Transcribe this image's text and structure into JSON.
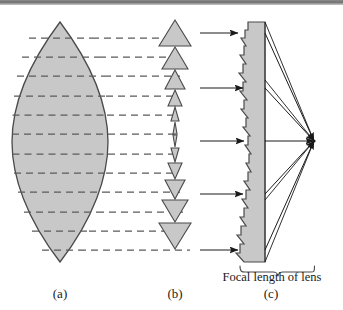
{
  "figure": {
    "background_color": "#ffffff",
    "glass_fill_color": "#c8c8c8",
    "outline_color": "#4a4a4a",
    "ray_color": "#1a1a1a",
    "dash_color": "#5a5a5a",
    "top_band_color": "#6f6f6f"
  },
  "labels": {
    "panel_a": "(a)",
    "panel_b": "(b)",
    "panel_c": "(c)",
    "focal_length_caption": "Focal length of lens"
  },
  "panels": {
    "a": {
      "name": "biconvex-lens",
      "description": "Solid biconvex lens sliced by dashed horizontal lines",
      "apex_top_y": 22,
      "apex_bottom_y": 262,
      "center_x": 60,
      "half_width": 48,
      "slice_count": 10,
      "slice_y_positions": [
        38,
        57,
        76,
        96,
        115,
        134,
        154,
        173,
        192,
        212,
        231,
        250
      ]
    },
    "b": {
      "name": "prism-stack",
      "description": "Vertical stack of prisms, large at the ends, thin near the centre",
      "center_x": 175,
      "prisms_up": [
        {
          "cy": 33,
          "half_w": 16,
          "h": 26
        },
        {
          "cy": 58,
          "half_w": 13,
          "h": 22
        },
        {
          "cy": 80,
          "half_w": 10,
          "h": 18
        },
        {
          "cy": 100,
          "half_w": 7,
          "h": 15
        },
        {
          "cy": 118,
          "half_w": 4,
          "h": 12
        },
        {
          "cy": 134,
          "half_w": 2,
          "h": 9
        }
      ],
      "prisms_down": [
        {
          "cy": 150,
          "half_w": 2,
          "h": 9
        },
        {
          "cy": 166,
          "half_w": 4,
          "h": 12
        },
        {
          "cy": 184,
          "half_w": 7,
          "h": 15
        },
        {
          "cy": 204,
          "half_w": 10,
          "h": 18
        },
        {
          "cy": 226,
          "half_w": 13,
          "h": 22
        },
        {
          "cy": 251,
          "half_w": 16,
          "h": 26
        }
      ]
    },
    "c": {
      "name": "fresnel-lens",
      "description": "Fresnel lens with sawtooth left face, flat right face and converging rays",
      "flat_face_x": 265,
      "top_y": 22,
      "bottom_y": 262,
      "focal_point": {
        "x": 314,
        "y": 141
      },
      "incoming_ray_count": 5,
      "incoming_ray_y": [
        33,
        88,
        141,
        194,
        250
      ],
      "incoming_ray_start_x": 200,
      "brace": {
        "left_x": 240,
        "right_x": 316,
        "y": 266
      }
    }
  },
  "icons": {
    "arrowhead": "ray-arrowhead",
    "brace": "curly-brace"
  }
}
